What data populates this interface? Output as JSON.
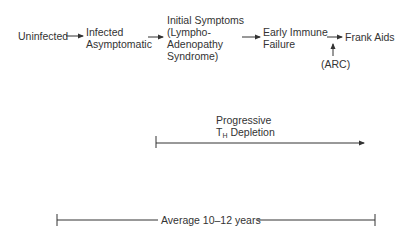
{
  "diagram": {
    "stages": [
      {
        "id": "uninfected",
        "lines": [
          "Uninfected"
        ]
      },
      {
        "id": "infected-asymptomatic",
        "lines": [
          "Infected",
          "Asymptomatic"
        ]
      },
      {
        "id": "initial-symptoms",
        "lines": [
          "Initial Symptoms",
          "(Lympho-",
          "Adenopathy",
          "Syndrome)"
        ]
      },
      {
        "id": "early-immune-failure",
        "lines": [
          "Early Immune",
          "Failure"
        ]
      },
      {
        "id": "frank-aids",
        "lines": [
          "Frank Aids"
        ]
      }
    ],
    "arc_label": "(ARC)",
    "depletion": {
      "line1": "Progressive",
      "t_letter": "T",
      "subscript": "H",
      "rest": " Depletion"
    },
    "duration_label": "Average 10–12 years"
  }
}
